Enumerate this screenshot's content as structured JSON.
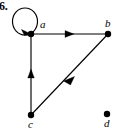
{
  "figure": {
    "number": "6.",
    "type": "directed-graph",
    "background_color": "#ffffff",
    "ink_color": "#000000"
  },
  "vertices": [
    {
      "id": "a",
      "label": "a",
      "x": 31,
      "y": 34,
      "label_x": 40,
      "label_y": 19
    },
    {
      "id": "b",
      "label": "b",
      "x": 108,
      "y": 34,
      "label_x": 105,
      "label_y": 18
    },
    {
      "id": "c",
      "label": "c",
      "x": 31,
      "y": 115,
      "label_x": 28,
      "label_y": 119
    },
    {
      "id": "d",
      "label": "d",
      "x": 107,
      "y": 114,
      "label_x": 104,
      "label_y": 118
    }
  ],
  "edges": [
    {
      "id": "loop-a",
      "from": "a",
      "to": "a",
      "kind": "self-loop",
      "directed": true,
      "arrow_position": "a"
    },
    {
      "id": "a-to-b",
      "from": "a",
      "to": "b",
      "kind": "straight",
      "directed": true,
      "arrow_position": "midpoint"
    },
    {
      "id": "b-to-c",
      "from": "b",
      "to": "c",
      "kind": "straight",
      "directed": true,
      "arrow_position": "midpoint"
    },
    {
      "id": "c-to-a",
      "from": "c",
      "to": "a",
      "kind": "straight",
      "directed": true,
      "arrow_position": "midpoint"
    }
  ],
  "isolated_vertices": [
    "d"
  ]
}
